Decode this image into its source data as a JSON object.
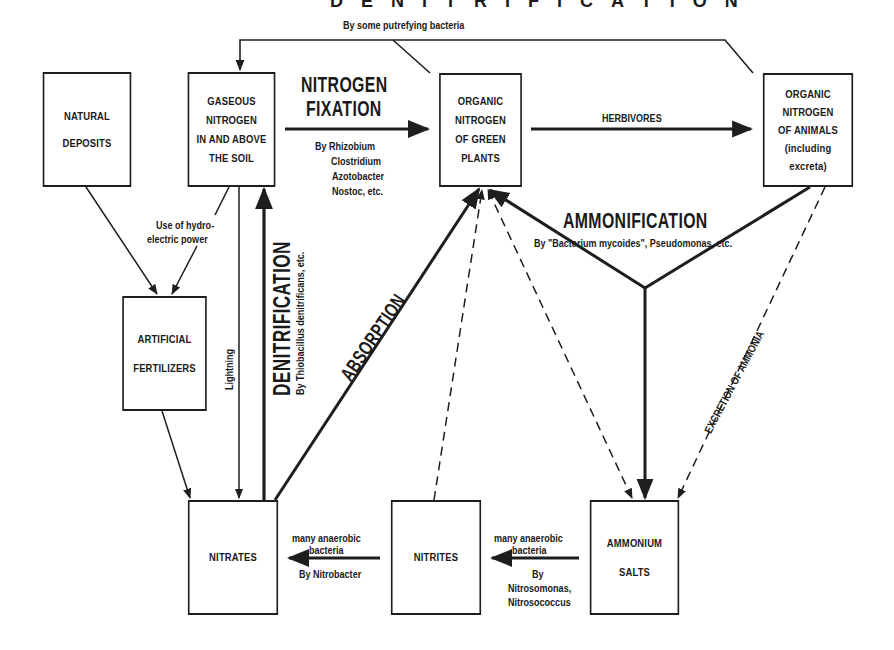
{
  "diagram": {
    "title": "DENITRIFICATION",
    "nodes": {
      "natural_deposits": {
        "lines": [
          "NATURAL",
          "DEPOSITS"
        ]
      },
      "gaseous_nitrogen": {
        "lines": [
          "GASEOUS",
          "NITROGEN",
          "IN AND ABOVE",
          "THE SOIL"
        ]
      },
      "green_plants": {
        "lines": [
          "ORGANIC",
          "NITROGEN",
          "OF GREEN",
          "PLANTS"
        ]
      },
      "animals": {
        "lines": [
          "ORGANIC",
          "NITROGEN",
          "OF ANIMALS",
          "(including",
          "excreta)"
        ]
      },
      "artificial_fertilizers": {
        "lines": [
          "ARTIFICIAL",
          "FERTILIZERS"
        ]
      },
      "nitrates": {
        "lines": [
          "NITRATES"
        ]
      },
      "nitrites": {
        "lines": [
          "NITRITES"
        ]
      },
      "ammonium_salts": {
        "lines": [
          "AMMONIUM",
          "SALTS"
        ]
      }
    },
    "labels": {
      "putrefying": "By some putrefying bacteria",
      "nitrogen_fixation_1": "NITROGEN",
      "nitrogen_fixation_2": "FIXATION",
      "fixation_by_1": "By Rhizobium",
      "fixation_by_2": "Clostridium",
      "fixation_by_3": "Azotobacter",
      "fixation_by_4": "Nostoc, etc.",
      "herbivores": "HERBIVORES",
      "hydro_1": "Use of hydro-",
      "hydro_2": "electric power",
      "lightning": "Lightning",
      "denitrification": "DENITRIFICATION",
      "denitrification_by": "By Thiobacillus denitrificans, etc.",
      "absorption": "ABSORPTION",
      "ammonification": "AMMONIFICATION",
      "ammonification_by": "By \"Bacterium mycoides\", Pseudomonas, etc.",
      "excretion": "EXCRETION OF AMMONIA",
      "nitrobacter_top_1": "many anaerobic",
      "nitrobacter_top_2": "bacteria",
      "nitrobacter_bottom": "By Nitrobacter",
      "nitrosomonas_top_1": "many anaerobic",
      "nitrosomonas_top_2": "bacteria",
      "nitrosomonas_bottom_1": "By",
      "nitrosomonas_bottom_2": "Nitrosomonas,",
      "nitrosomonas_bottom_3": "Nitrosococcus"
    },
    "colors": {
      "line": "#1e1e1e",
      "background": "#ffffff"
    }
  }
}
